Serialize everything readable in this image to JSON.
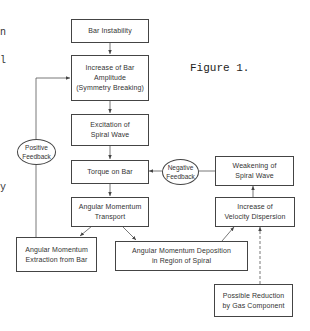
{
  "figure_label": "Figure 1.",
  "margin_fragments": [
    "n",
    "l",
    "y"
  ],
  "nodes": {
    "bar_instability": "Bar Instability",
    "increase_amplitude": "Increase of Bar\nAmplitude\n(Symmetry Breaking)",
    "excitation_spiral": "Excitation of\nSpiral Wave",
    "torque_on_bar": "Torque on Bar",
    "angular_momentum_transport": "Angular Momentum\nTransport",
    "angular_momentum_extraction": "Angular Momentum\nExtraction from Bar",
    "angular_momentum_deposition": "Angular Momentum Deposition\nin Region of Spiral",
    "increase_velocity_dispersion": "Increase of\nVelocity Dispersion",
    "weakening_spiral": "Weakening of\nSpiral Wave",
    "gas_reduction": "Possible Reduction\nby Gas Component"
  },
  "feedback": {
    "positive": "Positive\nFeedback",
    "negative": "Negative\nFeedback"
  },
  "edges": [
    {
      "from": "bar_instability",
      "to": "increase_amplitude",
      "style": "solid"
    },
    {
      "from": "increase_amplitude",
      "to": "excitation_spiral",
      "style": "solid"
    },
    {
      "from": "excitation_spiral",
      "to": "torque_on_bar",
      "style": "solid"
    },
    {
      "from": "torque_on_bar",
      "to": "angular_momentum_transport",
      "style": "solid"
    },
    {
      "from": "angular_momentum_transport",
      "to": "angular_momentum_extraction",
      "style": "solid"
    },
    {
      "from": "angular_momentum_transport",
      "to": "angular_momentum_deposition",
      "style": "solid"
    },
    {
      "from": "angular_momentum_deposition",
      "to": "increase_velocity_dispersion",
      "style": "solid"
    },
    {
      "from": "increase_velocity_dispersion",
      "to": "weakening_spiral",
      "style": "solid"
    },
    {
      "from": "weakening_spiral",
      "to": "torque_on_bar",
      "style": "solid",
      "via": "negative_feedback"
    },
    {
      "from": "angular_momentum_extraction",
      "to": "increase_amplitude",
      "style": "solid",
      "via": "positive_feedback"
    },
    {
      "from": "gas_reduction",
      "to": "increase_velocity_dispersion",
      "style": "dashed"
    }
  ]
}
